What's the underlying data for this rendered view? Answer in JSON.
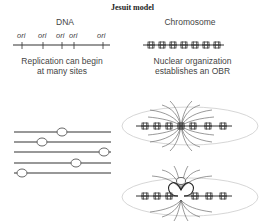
{
  "title": "Jesuit model",
  "left_top": {
    "heading": "DNA",
    "ori_label": "ori",
    "ori_positions": [
      22,
      43,
      62,
      74,
      103
    ],
    "caption_line1": "Replication can begin",
    "caption_line2": "at many sites"
  },
  "right_top": {
    "heading": "Chromosome",
    "caption_line1": "Nuclear organization",
    "caption_line2": "establishes an OBR"
  },
  "left_bottom": {
    "strand_count": 5,
    "bubble_positions": [
      62,
      42,
      104,
      76,
      22
    ]
  },
  "right_bottom": {
    "panels": [
      "nucleosome array with converging field lines",
      "nucleosome array with origin loop and bubble"
    ]
  },
  "colors": {
    "line": "#333333",
    "ellipse": "#cccccc",
    "text": "#444444"
  }
}
